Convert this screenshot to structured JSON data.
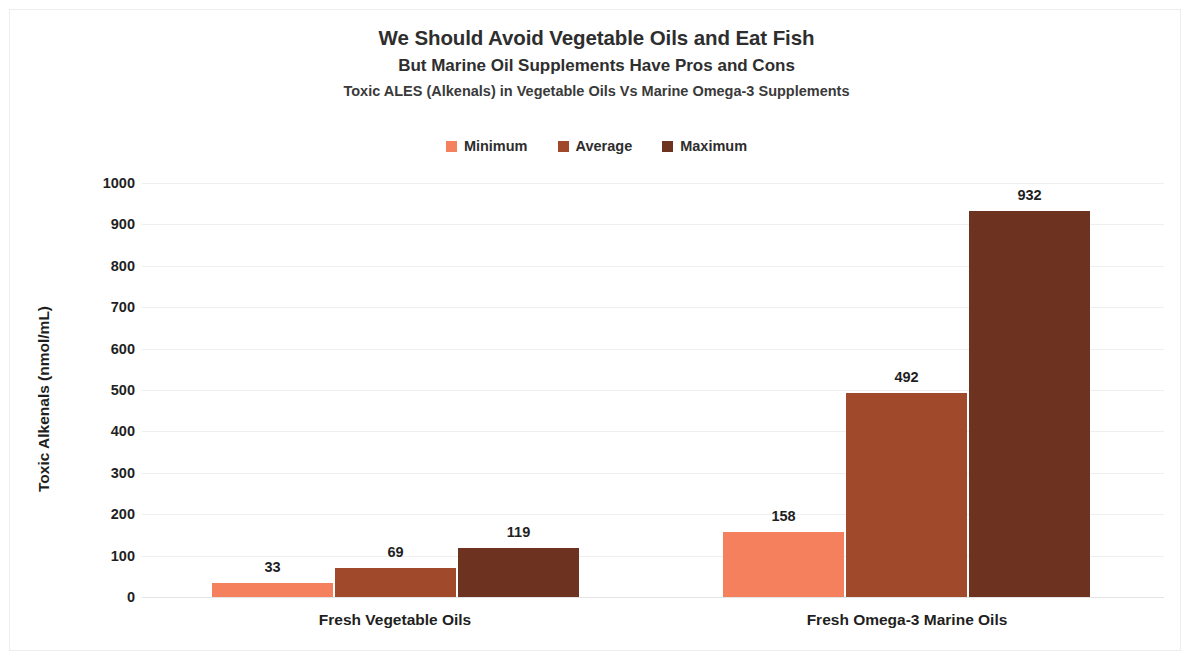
{
  "titles": {
    "main": "We Should Avoid Vegetable Oils and Eat Fish",
    "sub": "But Marine Oil Supplements Have Pros and Cons",
    "sub2": "Toxic ALES (Alkenals) in Vegetable Oils Vs Marine Omega-3 Supplements"
  },
  "chart_data": {
    "type": "bar",
    "title": "We Should Avoid Vegetable Oils and Eat Fish",
    "subtitle": "But Marine Oil Supplements Have Pros and Cons",
    "subtitle2": "Toxic ALES (Alkenals) in Vegetable Oils Vs Marine Omega-3 Supplements",
    "xlabel": "",
    "ylabel": "Toxic Alkenals (nmol/mL)",
    "ylim": [
      0,
      1000
    ],
    "yticks": [
      0,
      100,
      200,
      300,
      400,
      500,
      600,
      700,
      800,
      900,
      1000
    ],
    "grid": true,
    "legend_position": "top",
    "categories": [
      "Fresh Vegetable Oils",
      "Fresh Omega-3 Marine Oils"
    ],
    "series": [
      {
        "name": "Minimum",
        "color": "#F4805E",
        "values": [
          33,
          158
        ]
      },
      {
        "name": "Average",
        "color": "#A04A2B",
        "values": [
          69,
          492
        ]
      },
      {
        "name": "Maximum",
        "color": "#6E3220",
        "values": [
          119,
          932
        ]
      }
    ]
  },
  "colors": {
    "minimum": "#F4805E",
    "average": "#A04A2B",
    "maximum": "#6E3220",
    "gridline": "#efefef",
    "text": "#1f1f1f",
    "background": "#ffffff"
  }
}
